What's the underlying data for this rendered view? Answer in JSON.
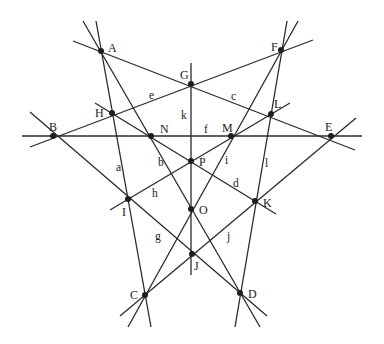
{
  "diagram": {
    "title": "",
    "points": [
      {
        "name": "A",
        "x": 101,
        "y": 51,
        "lx": 108,
        "ly": 52
      },
      {
        "name": "F",
        "x": 281,
        "y": 50,
        "lx": 271,
        "ly": 51
      },
      {
        "name": "G",
        "x": 191,
        "y": 84,
        "lx": 180,
        "ly": 79
      },
      {
        "name": "H",
        "x": 112,
        "y": 113,
        "lx": 95,
        "ly": 117
      },
      {
        "name": "L",
        "x": 271,
        "y": 114,
        "lx": 274,
        "ly": 108
      },
      {
        "name": "B",
        "x": 53,
        "y": 136,
        "lx": 49,
        "ly": 131
      },
      {
        "name": "N",
        "x": 151,
        "y": 136,
        "lx": 160,
        "ly": 133
      },
      {
        "name": "M",
        "x": 231,
        "y": 136,
        "lx": 222,
        "ly": 132
      },
      {
        "name": "E",
        "x": 331,
        "y": 136,
        "lx": 325,
        "ly": 131
      },
      {
        "name": "P",
        "x": 191,
        "y": 161,
        "lx": 199,
        "ly": 166
      },
      {
        "name": "I",
        "x": 128,
        "y": 199,
        "lx": 122,
        "ly": 216
      },
      {
        "name": "K",
        "x": 255,
        "y": 201,
        "lx": 263,
        "ly": 207
      },
      {
        "name": "O",
        "x": 191,
        "y": 209,
        "lx": 199,
        "ly": 214
      },
      {
        "name": "J",
        "x": 192,
        "y": 254,
        "lx": 194,
        "ly": 270
      },
      {
        "name": "C",
        "x": 145,
        "y": 295,
        "lx": 130,
        "ly": 299
      },
      {
        "name": "D",
        "x": 240,
        "y": 293,
        "lx": 248,
        "ly": 298
      }
    ],
    "lines": [
      {
        "name": "a",
        "x1": 96,
        "y1": 21,
        "x2": 151,
        "y2": 327,
        "lx": 116,
        "ly": 171
      },
      {
        "name": "b",
        "x1": 83,
        "y1": 21,
        "x2": 260,
        "y2": 327,
        "lx": 158,
        "ly": 166
      },
      {
        "name": "c",
        "x1": 73,
        "y1": 41,
        "x2": 355,
        "y2": 150,
        "lx": 231,
        "ly": 100
      },
      {
        "name": "d",
        "x1": 95,
        "y1": 103,
        "x2": 276,
        "y2": 214,
        "lx": 233,
        "ly": 187
      },
      {
        "name": "e",
        "x1": 30,
        "y1": 147,
        "x2": 313,
        "y2": 40,
        "lx": 149,
        "ly": 99
      },
      {
        "name": "f",
        "x1": 22,
        "y1": 136,
        "x2": 362,
        "y2": 136,
        "lx": 204,
        "ly": 133
      },
      {
        "name": "g",
        "x1": 30,
        "y1": 112,
        "x2": 267,
        "y2": 316,
        "lx": 155,
        "ly": 240
      },
      {
        "name": "h",
        "x1": 290,
        "y1": 103,
        "x2": 110,
        "y2": 210,
        "lx": 152,
        "ly": 197
      },
      {
        "name": "i",
        "x1": 128,
        "y1": 327,
        "x2": 298,
        "y2": 21,
        "lx": 225,
        "ly": 164
      },
      {
        "name": "j",
        "x1": 120,
        "y1": 316,
        "x2": 356,
        "y2": 118,
        "lx": 227,
        "ly": 240
      },
      {
        "name": "k",
        "x1": 191,
        "y1": 63,
        "x2": 191,
        "y2": 275,
        "lx": 181,
        "ly": 119
      },
      {
        "name": "l",
        "x1": 287,
        "y1": 21,
        "x2": 235,
        "y2": 327,
        "lx": 265,
        "ly": 167
      }
    ]
  }
}
